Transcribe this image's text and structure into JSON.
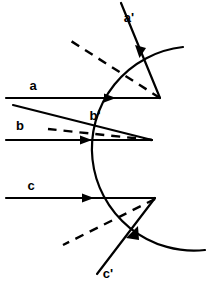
{
  "figure": {
    "type": "optics-ray-diagram",
    "title": "",
    "background_color": "#ffffff",
    "stroke_color": "#000000",
    "width": 223,
    "height": 285
  },
  "surface": {
    "name": "circular-mirror-surface",
    "shape": "circle-arc",
    "center": [
      232,
      135
    ],
    "radius": 83,
    "arc_start": [
      183,
      47
    ],
    "arc_end": [
      205,
      250
    ],
    "stroke_width": 2
  },
  "rays": [
    {
      "id": "a",
      "label": "a",
      "label_pos": [
        33,
        90
      ],
      "kind": "incident",
      "style": "solid",
      "from": [
        6,
        98
      ],
      "to": [
        160,
        98
      ],
      "arrow_at": [
        112,
        98
      ],
      "arrow_dir": "right"
    },
    {
      "id": "a-prime",
      "label": "a'",
      "label_pos": [
        129,
        22
      ],
      "kind": "reflected",
      "style": "solid",
      "from": [
        160,
        98
      ],
      "to": [
        121,
        3
      ],
      "arrow_at": [
        140,
        50
      ],
      "arrow_dir": "up-left"
    },
    {
      "id": "a-normal",
      "label": "",
      "label_pos": [
        0,
        0
      ],
      "kind": "construction-normal",
      "style": "dashed",
      "from": [
        160,
        98
      ],
      "to": [
        71,
        41
      ],
      "arrow_at": null,
      "arrow_dir": ""
    },
    {
      "id": "b",
      "label": "b",
      "label_pos": [
        20,
        130
      ],
      "kind": "incident",
      "style": "solid",
      "from": [
        6,
        140
      ],
      "to": [
        152,
        140
      ],
      "arrow_at": [
        88,
        140
      ],
      "arrow_dir": "right"
    },
    {
      "id": "b-prime",
      "label": "b'",
      "label_pos": [
        95,
        120
      ],
      "kind": "reflected",
      "style": "solid",
      "from": [
        152,
        140
      ],
      "to": [
        13,
        105
      ],
      "arrow_at": null,
      "arrow_dir": ""
    },
    {
      "id": "b-normal",
      "label": "",
      "label_pos": [
        0,
        0
      ],
      "kind": "construction-normal",
      "style": "dashed",
      "from": [
        152,
        140
      ],
      "to": [
        48,
        129
      ],
      "arrow_at": null,
      "arrow_dir": ""
    },
    {
      "id": "c",
      "label": "c",
      "label_pos": [
        31,
        190
      ],
      "kind": "incident",
      "style": "solid",
      "from": [
        6,
        198
      ],
      "to": [
        155,
        198
      ],
      "arrow_at": [
        90,
        198
      ],
      "arrow_dir": "right"
    },
    {
      "id": "c-prime",
      "label": "c'",
      "label_pos": [
        108,
        278
      ],
      "kind": "reflected",
      "style": "solid",
      "from": [
        155,
        198
      ],
      "to": [
        97,
        274
      ],
      "arrow_at": [
        131,
        233
      ],
      "arrow_dir": "down-left"
    },
    {
      "id": "c-normal",
      "label": "",
      "label_pos": [
        0,
        0
      ],
      "kind": "construction-normal",
      "style": "dashed",
      "from": [
        155,
        199
      ],
      "to": [
        63,
        245
      ],
      "arrow_at": null,
      "arrow_dir": ""
    }
  ],
  "impact_points": [
    {
      "id": "impact-a",
      "at": [
        160,
        98
      ]
    },
    {
      "id": "impact-b",
      "at": [
        152,
        140
      ]
    },
    {
      "id": "impact-c",
      "at": [
        155,
        198
      ]
    }
  ],
  "labels": {
    "a": "a",
    "a_prime": "a'",
    "b": "b",
    "b_prime": "b'",
    "c": "c",
    "c_prime": "c'"
  }
}
